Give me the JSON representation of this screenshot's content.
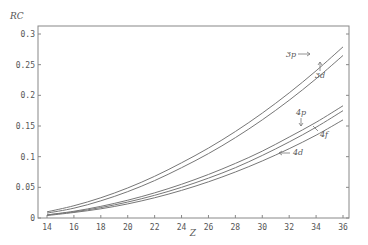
{
  "chart_data": {
    "type": "line",
    "title": "",
    "xlabel": "Z",
    "ylabel": "RC",
    "xlim": [
      14,
      36
    ],
    "ylim": [
      0,
      0.3
    ],
    "xticks": [
      14,
      16,
      18,
      20,
      22,
      24,
      26,
      28,
      30,
      32,
      34,
      36
    ],
    "xtick_labels": [
      "14",
      "16",
      "18",
      "20",
      "22",
      "24",
      "26",
      "28",
      "30",
      "32",
      "34",
      "36"
    ],
    "yticks": [
      0,
      0.05,
      0.1,
      0.15,
      0.2,
      0.25,
      0.3
    ],
    "ytick_labels": [
      "0",
      "0.05",
      "0.1",
      "0.15",
      "0.2",
      "0.25",
      "0.3"
    ],
    "grid": false,
    "legend": "none",
    "x": [
      14,
      16,
      18,
      20,
      22,
      24,
      26,
      28,
      30,
      32,
      34,
      36
    ],
    "series": [
      {
        "name": "3p",
        "values": [
          0.01,
          0.02,
          0.033,
          0.049,
          0.068,
          0.09,
          0.114,
          0.141,
          0.171,
          0.204,
          0.24,
          0.279
        ]
      },
      {
        "name": "3d",
        "values": [
          0.008,
          0.016,
          0.028,
          0.043,
          0.061,
          0.082,
          0.105,
          0.131,
          0.16,
          0.192,
          0.227,
          0.265
        ]
      },
      {
        "name": "4p",
        "values": [
          0.005,
          0.011,
          0.019,
          0.029,
          0.041,
          0.055,
          0.071,
          0.089,
          0.109,
          0.132,
          0.156,
          0.183
        ]
      },
      {
        "name": "4f",
        "values": [
          0.005,
          0.01,
          0.017,
          0.026,
          0.037,
          0.05,
          0.065,
          0.082,
          0.102,
          0.124,
          0.148,
          0.175
        ]
      },
      {
        "name": "4d",
        "values": [
          0.004,
          0.009,
          0.015,
          0.023,
          0.033,
          0.045,
          0.059,
          0.075,
          0.093,
          0.113,
          0.135,
          0.16
        ]
      }
    ],
    "annotations": [
      {
        "text": "3p",
        "target": "3p",
        "arrow": "right"
      },
      {
        "text": "3d",
        "target": "3d",
        "arrow": "up"
      },
      {
        "text": "4p",
        "target": "4p",
        "arrow": "down"
      },
      {
        "text": "4f",
        "target": "4f",
        "arrow": "up-left"
      },
      {
        "text": "4d",
        "target": "4d",
        "arrow": "left"
      }
    ]
  }
}
